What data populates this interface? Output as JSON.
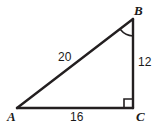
{
  "figure": {
    "type": "right-triangle-diagram",
    "background_color": "#ffffff",
    "stroke_color": "#231f20",
    "stroke_width": 2,
    "canvas": {
      "width": 161,
      "height": 128
    },
    "vertices": [
      {
        "name": "A",
        "label": "A",
        "x": 17,
        "y": 108
      },
      {
        "name": "B",
        "label": "B",
        "x": 133,
        "y": 19
      },
      {
        "name": "C",
        "label": "C",
        "x": 133,
        "y": 108
      }
    ],
    "sides": [
      {
        "name": "AB",
        "label": "20",
        "role": "hypotenuse"
      },
      {
        "name": "BC",
        "label": "12",
        "role": "vertical-leg"
      },
      {
        "name": "AC",
        "label": "16",
        "role": "horizontal-leg"
      }
    ],
    "markers": [
      {
        "name": "angle-arc-b",
        "at_vertex": "B",
        "kind": "arc"
      },
      {
        "name": "right-angle-c",
        "at_vertex": "C",
        "kind": "square"
      }
    ]
  }
}
